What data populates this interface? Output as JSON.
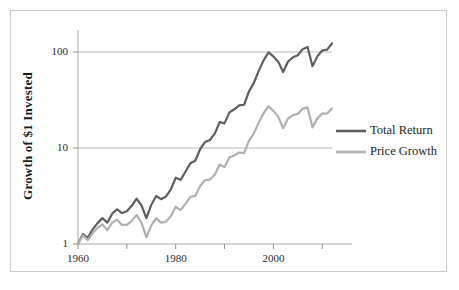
{
  "figure": {
    "frame_color": "#c9c9c9",
    "background": "#ffffff"
  },
  "chart_data": {
    "type": "line",
    "title": "",
    "xlabel": "",
    "ylabel": "Growth of $1 Invested",
    "yscale": "log",
    "ylim": [
      1,
      200
    ],
    "xlim": [
      1960,
      2012
    ],
    "grid": "horizontal",
    "legend_position": "right-middle",
    "ytick_labels": [
      "1",
      "10",
      "100"
    ],
    "ytick_values": [
      1,
      10,
      100
    ],
    "xtick_labels": [
      "1960",
      "1980",
      "2000"
    ],
    "xtick_values": [
      1960,
      1980,
      2000
    ],
    "xminor_ticks": [
      1970,
      1990,
      2010
    ],
    "series": [
      {
        "name": "Total Return",
        "color": "#5f5f5f",
        "x": [
          1960,
          1961,
          1962,
          1963,
          1964,
          1965,
          1966,
          1967,
          1968,
          1969,
          1970,
          1971,
          1972,
          1973,
          1974,
          1975,
          1976,
          1977,
          1978,
          1979,
          1980,
          1981,
          1982,
          1983,
          1984,
          1985,
          1986,
          1987,
          1988,
          1989,
          1990,
          1991,
          1992,
          1993,
          1994,
          1995,
          1996,
          1997,
          1998,
          1999,
          2000,
          2001,
          2002,
          2003,
          2004,
          2005,
          2006,
          2007,
          2008,
          2009,
          2010,
          2011,
          2012
        ],
        "values": [
          1.0,
          1.27,
          1.16,
          1.42,
          1.65,
          1.86,
          1.67,
          2.07,
          2.3,
          2.1,
          2.19,
          2.5,
          2.97,
          2.53,
          1.86,
          2.55,
          3.16,
          2.93,
          3.12,
          3.7,
          4.9,
          4.66,
          5.66,
          6.94,
          7.37,
          9.71,
          11.52,
          12.12,
          14.13,
          18.61,
          18.03,
          23.52,
          25.31,
          27.85,
          28.22,
          38.81,
          47.71,
          63.63,
          81.82,
          99.02,
          90.01,
          79.32,
          61.79,
          79.53,
          88.17,
          92.5,
          107.13,
          113.0,
          71.19,
          90.05,
          103.63,
          105.79,
          122.7
        ],
        "line_width": 2.2
      },
      {
        "name": "Price Growth",
        "color": "#b0b0b0",
        "x": [
          1960,
          1961,
          1962,
          1963,
          1964,
          1965,
          1966,
          1967,
          1968,
          1969,
          1970,
          1971,
          1972,
          1973,
          1974,
          1975,
          1976,
          1977,
          1978,
          1979,
          1980,
          1981,
          1982,
          1983,
          1984,
          1985,
          1986,
          1987,
          1988,
          1989,
          1990,
          1991,
          1992,
          1993,
          1994,
          1995,
          1996,
          1997,
          1998,
          1999,
          2000,
          2001,
          2002,
          2003,
          2004,
          2005,
          2006,
          2007,
          2008,
          2009,
          2010,
          2011,
          2012
        ],
        "values": [
          1.0,
          1.23,
          1.1,
          1.3,
          1.47,
          1.6,
          1.39,
          1.67,
          1.79,
          1.58,
          1.58,
          1.74,
          2.01,
          1.66,
          1.18,
          1.56,
          1.86,
          1.67,
          1.71,
          1.94,
          2.45,
          2.25,
          2.62,
          3.1,
          3.17,
          4.02,
          4.61,
          4.69,
          5.26,
          6.72,
          6.32,
          7.99,
          8.35,
          8.97,
          8.85,
          11.86,
          14.2,
          18.4,
          23.08,
          27.25,
          24.35,
          21.08,
          16.08,
          20.28,
          22.02,
          22.69,
          25.7,
          26.53,
          16.4,
          20.36,
          22.86,
          22.86,
          25.9
        ],
        "line_width": 2.2
      }
    ]
  },
  "legend": {
    "items": [
      {
        "label": "Total Return",
        "color": "#5f5f5f"
      },
      {
        "label": "Price Growth",
        "color": "#b0b0b0"
      }
    ]
  }
}
